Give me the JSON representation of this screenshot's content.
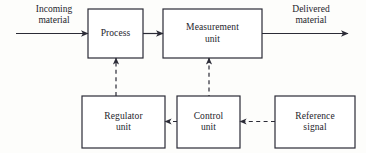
{
  "diagram": {
    "colors": {
      "background": "#fdfdfb",
      "stroke": "#2b2b36",
      "box_fill": "#ffffff",
      "text": "#24242c"
    },
    "boxes": [
      {
        "id": "process",
        "label": "Process",
        "x": 88,
        "y": 9,
        "w": 55,
        "h": 49
      },
      {
        "id": "measurement-unit",
        "label": "Measurement\nunit",
        "x": 163,
        "y": 9,
        "w": 99,
        "h": 49
      },
      {
        "id": "regulator-unit",
        "label": "Regulator\nunit",
        "x": 82,
        "y": 96,
        "w": 83,
        "h": 52
      },
      {
        "id": "control-unit",
        "label": "Control\nunit",
        "x": 177,
        "y": 96,
        "w": 63,
        "h": 52
      },
      {
        "id": "reference-signal",
        "label": "Reference\nsignal",
        "x": 275,
        "y": 96,
        "w": 80,
        "h": 52
      }
    ],
    "edge_labels": [
      {
        "id": "incoming-material",
        "label": "Incoming\nmaterial",
        "x": 18,
        "y": 4,
        "w": 72
      },
      {
        "id": "delivered-material",
        "label": "Delivered\nmaterial",
        "x": 272,
        "y": 4,
        "w": 78
      }
    ],
    "connections": [
      {
        "id": "incoming-to-process",
        "style": "solid",
        "from": "incoming material",
        "to": "process"
      },
      {
        "id": "process-to-measurement",
        "style": "solid",
        "from": "process",
        "to": "measurement unit"
      },
      {
        "id": "measurement-to-delivered",
        "style": "solid",
        "from": "measurement unit",
        "to": "delivered material"
      },
      {
        "id": "measurement-to-control",
        "style": "dashed",
        "from": "measurement unit",
        "to": "control unit"
      },
      {
        "id": "reference-to-control",
        "style": "dashed",
        "from": "reference signal",
        "to": "control unit"
      },
      {
        "id": "control-to-regulator",
        "style": "dashed",
        "from": "control unit",
        "to": "regulator unit"
      },
      {
        "id": "regulator-to-process",
        "style": "dashed",
        "from": "regulator unit",
        "to": "process"
      }
    ]
  }
}
